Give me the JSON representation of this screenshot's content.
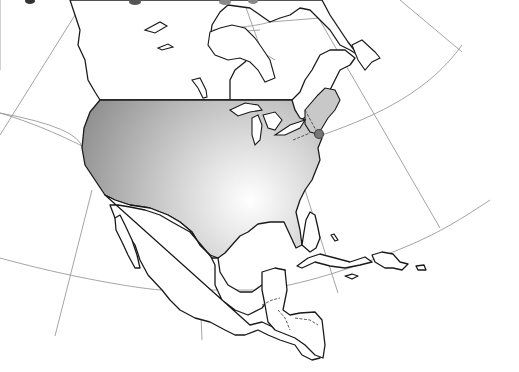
{
  "map": {
    "title": "",
    "region": "North America",
    "projection": "conic (graticule visible)",
    "highlighted_region": {
      "name": "United States (contiguous)",
      "fill_gradient": {
        "dark": "#8c8c8c",
        "light": "#ffffff",
        "light_center_x": 250,
        "light_center_y": 200
      }
    },
    "northeast_subregion": {
      "name": "Northeastern US",
      "fill": "#c8c8c8"
    },
    "marker": {
      "name": "location-marker",
      "x": 319,
      "y": 134,
      "fill": "#777777",
      "stroke": "#444444"
    },
    "colors": {
      "background": "#ffffff",
      "coastline": "#1a1a1a",
      "graticule": "#9a9a9a"
    }
  }
}
